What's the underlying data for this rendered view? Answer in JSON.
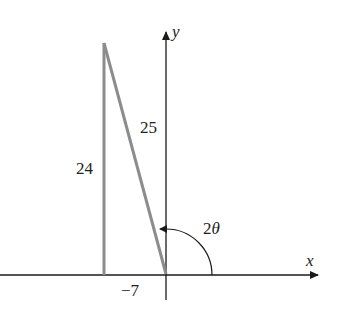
{
  "diagram": {
    "axes": {
      "x_label": "x",
      "y_label": "y"
    },
    "triangle": {
      "vertical_leg_label": "24",
      "hypotenuse_label": "25",
      "horizontal_label": "−7"
    },
    "angle": {
      "coefficient": "2",
      "symbol": "θ"
    },
    "colors": {
      "axis": "#1a1a1a",
      "triangle": "#8c8c8c"
    }
  }
}
